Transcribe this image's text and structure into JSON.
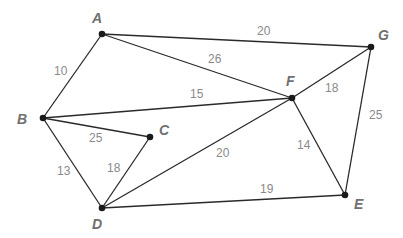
{
  "graph": {
    "nodes": [
      {
        "id": "A",
        "label": "A",
        "x": 102,
        "y": 34,
        "lx": 92,
        "ly": 23
      },
      {
        "id": "B",
        "label": "B",
        "x": 43,
        "y": 118,
        "lx": 17,
        "ly": 124
      },
      {
        "id": "C",
        "label": "C",
        "x": 150,
        "y": 137,
        "lx": 159,
        "ly": 135
      },
      {
        "id": "D",
        "label": "D",
        "x": 102,
        "y": 208,
        "lx": 92,
        "ly": 229
      },
      {
        "id": "E",
        "label": "E",
        "x": 345,
        "y": 195,
        "lx": 354,
        "ly": 209
      },
      {
        "id": "F",
        "label": "F",
        "x": 292,
        "y": 98,
        "lx": 286,
        "ly": 86
      },
      {
        "id": "G",
        "label": "G",
        "x": 371,
        "y": 47,
        "lx": 378,
        "ly": 40
      }
    ],
    "edges": [
      {
        "from": "A",
        "to": "G",
        "weight": "20",
        "lx": 257,
        "ly": 35
      },
      {
        "from": "A",
        "to": "F",
        "weight": "26",
        "lx": 208,
        "ly": 63
      },
      {
        "from": "A",
        "to": "B",
        "weight": "10",
        "lx": 54,
        "ly": 75
      },
      {
        "from": "B",
        "to": "F",
        "weight": "15",
        "lx": 190,
        "ly": 98
      },
      {
        "from": "B",
        "to": "C",
        "weight": "25",
        "lx": 89,
        "ly": 142
      },
      {
        "from": "B",
        "to": "D",
        "weight": "13",
        "lx": 57,
        "ly": 175
      },
      {
        "from": "C",
        "to": "D",
        "weight": "18",
        "lx": 107,
        "ly": 172
      },
      {
        "from": "D",
        "to": "F",
        "weight": "20",
        "lx": 216,
        "ly": 157
      },
      {
        "from": "D",
        "to": "E",
        "weight": "19",
        "lx": 260,
        "ly": 193
      },
      {
        "from": "F",
        "to": "G",
        "weight": "18",
        "lx": 325,
        "ly": 92
      },
      {
        "from": "F",
        "to": "E",
        "weight": "14",
        "lx": 297,
        "ly": 149
      },
      {
        "from": "G",
        "to": "E",
        "weight": "25",
        "lx": 369,
        "ly": 119
      }
    ]
  }
}
